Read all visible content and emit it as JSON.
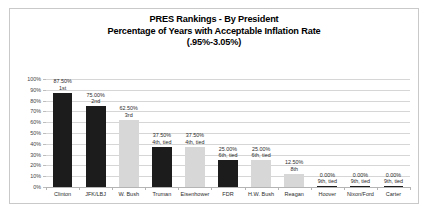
{
  "chart_data": {
    "type": "bar",
    "title": "PRES Rankings - By President Percentage of Years with Acceptable Inflation Rate (.95%-3.05%)",
    "title_lines": [
      "PRES Rankings - By President",
      "Percentage of Years with Acceptable Inflation Rate",
      "(.95%-3.05%)"
    ],
    "xlabel": "",
    "ylabel": "",
    "ylim": [
      0,
      100
    ],
    "grid": true,
    "legend": "none",
    "categories": [
      "Clinton",
      "JFK/LBJ",
      "W. Bush",
      "Truman",
      "Eisenhower",
      "FDR",
      "H.W. Bush",
      "Reagan",
      "Hoover",
      "Nixon/Ford",
      "Carter"
    ],
    "values": [
      87.5,
      75.0,
      62.5,
      37.5,
      37.5,
      25.0,
      25.0,
      12.5,
      0.0,
      0.0,
      0.0
    ],
    "value_labels": [
      "87.50%",
      "75.00%",
      "62.50%",
      "37.50%",
      "37.50%",
      "25.00%",
      "25.00%",
      "12.50%",
      "0.00%",
      "0.00%",
      "0.00%"
    ],
    "rank_labels": [
      "1st",
      "2nd",
      "3rd",
      "4th, tied",
      "4th, tied",
      "6th, tied",
      "6th, tied",
      "8th",
      "9th, tied",
      "9th, tied",
      "9th, tied"
    ],
    "bar_colors": [
      "#1c1c1c",
      "#1c1c1c",
      "#d7d7d7",
      "#1c1c1c",
      "#d7d7d7",
      "#1c1c1c",
      "#d7d7d7",
      "#d7d7d7",
      "#1c1c1c",
      "#1c1c1c",
      "#1c1c1c"
    ],
    "bar_shades": [
      "dark",
      "dark",
      "light",
      "dark",
      "light",
      "dark",
      "light",
      "light",
      "zero",
      "zero",
      "zero"
    ],
    "y_ticks": [
      "100%",
      "90%",
      "80%",
      "70%",
      "60%",
      "50%",
      "40%",
      "30%",
      "20%",
      "10%",
      "0%"
    ],
    "y_tick_values": [
      100,
      90,
      80,
      70,
      60,
      50,
      40,
      30,
      20,
      10,
      0
    ]
  },
  "colors": {
    "frame": "#c9c9c9",
    "gridline": "#d6d6d6",
    "axis": "#b4b4b4",
    "dark_bar": "#1c1c1c",
    "light_bar": "#d7d7d7",
    "text": "#2b2b2b",
    "background": "#ffffff"
  }
}
